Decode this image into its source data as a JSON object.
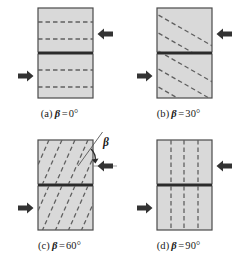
{
  "figure": {
    "type": "technical-diagram",
    "colors": {
      "specimen_fill": "#d9d9d9",
      "specimen_stroke": "#4a4a4a",
      "split_line": "#2b2b2b",
      "dash_line": "#606060",
      "arrow_fill": "#333333",
      "text": "#1a1a1a",
      "background": "#ffffff"
    },
    "symbols": {
      "beta": "β",
      "degree": "°",
      "equals": "="
    },
    "panels": [
      {
        "id": "a",
        "label": "(a)",
        "variable": "β",
        "equals": "=",
        "value": "0°",
        "caption": "(a) β = 0°",
        "bedding_angle_deg": 0,
        "bedding_orientation": "horizontal",
        "dash_count": 4,
        "arrow_right_direction": "left",
        "arrow_left_direction": "right",
        "has_angle_annotation": false
      },
      {
        "id": "b",
        "label": "(b)",
        "variable": "β",
        "equals": "=",
        "value": "30°",
        "caption": "(b) β = 30°",
        "bedding_angle_deg": 30,
        "bedding_orientation": "inclined",
        "dash_count": 5,
        "arrow_right_direction": "left",
        "arrow_left_direction": "right",
        "has_angle_annotation": false
      },
      {
        "id": "c",
        "label": "(c)",
        "variable": "β",
        "equals": "=",
        "value": "60°",
        "caption": "(c) β = 60°",
        "bedding_angle_deg": 60,
        "bedding_orientation": "inclined-steep",
        "dash_count": 6,
        "arrow_right_direction": "left",
        "arrow_left_direction": "right",
        "has_angle_annotation": true,
        "angle_annotation_label": "β"
      },
      {
        "id": "d",
        "label": "(d)",
        "variable": "β",
        "equals": "=",
        "value": "90°",
        "caption": "(d) β = 90°",
        "bedding_angle_deg": 90,
        "bedding_orientation": "vertical",
        "dash_count": 3,
        "arrow_right_direction": "left",
        "arrow_left_direction": "right",
        "has_angle_annotation": false
      }
    ]
  }
}
